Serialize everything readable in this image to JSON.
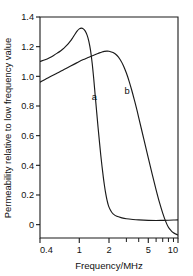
{
  "chart_data": {
    "type": "line",
    "title": "",
    "xlabel": "Frequency/MHz",
    "ylabel": "Permeability relative to low frequency value",
    "xscale": "log",
    "xlim": [
      0.4,
      10
    ],
    "ylim": [
      -0.09,
      1.4
    ],
    "grid": false,
    "legend_position": "inline-annotations",
    "x_ticks_major": [
      0.4,
      1,
      2,
      5,
      10
    ],
    "x_tick_labels": [
      "0.4",
      "1",
      "2",
      "5",
      "10"
    ],
    "x_ticks_minor": [
      3,
      4,
      6,
      7,
      8,
      9
    ],
    "y_ticks": [
      0,
      0.2,
      0.4,
      0.6,
      0.8,
      1.0,
      1.2,
      1.4
    ],
    "y_tick_labels": [
      "0",
      "0.2",
      "0.4",
      "0.6",
      "0.8",
      "1.0",
      "1.2",
      "1.4"
    ],
    "annotations": [
      {
        "text": "a",
        "x": 1.42,
        "y": 0.84
      },
      {
        "text": "b",
        "x": 3.05,
        "y": 0.88
      }
    ],
    "series": [
      {
        "name": "a",
        "label": "a",
        "color": "#1a1a1a",
        "points": [
          [
            0.4,
            1.1
          ],
          [
            0.45,
            1.112
          ],
          [
            0.5,
            1.126
          ],
          [
            0.55,
            1.141
          ],
          [
            0.6,
            1.157
          ],
          [
            0.65,
            1.173
          ],
          [
            0.7,
            1.19
          ],
          [
            0.75,
            1.21
          ],
          [
            0.8,
            1.232
          ],
          [
            0.85,
            1.256
          ],
          [
            0.9,
            1.282
          ],
          [
            0.95,
            1.305
          ],
          [
            1.0,
            1.32
          ],
          [
            1.05,
            1.325
          ],
          [
            1.1,
            1.32
          ],
          [
            1.15,
            1.305
          ],
          [
            1.2,
            1.278
          ],
          [
            1.25,
            1.236
          ],
          [
            1.3,
            1.175
          ],
          [
            1.35,
            1.09
          ],
          [
            1.4,
            0.985
          ],
          [
            1.45,
            0.87
          ],
          [
            1.5,
            0.76
          ],
          [
            1.55,
            0.655
          ],
          [
            1.6,
            0.56
          ],
          [
            1.65,
            0.47
          ],
          [
            1.7,
            0.392
          ],
          [
            1.75,
            0.322
          ],
          [
            1.8,
            0.262
          ],
          [
            1.85,
            0.212
          ],
          [
            1.9,
            0.172
          ],
          [
            1.95,
            0.141
          ],
          [
            2.0,
            0.118
          ],
          [
            2.1,
            0.09
          ],
          [
            2.2,
            0.073
          ],
          [
            2.4,
            0.056
          ],
          [
            2.7,
            0.046
          ],
          [
            3.0,
            0.04
          ],
          [
            3.5,
            0.035
          ],
          [
            4.0,
            0.032
          ],
          [
            5.0,
            0.029
          ],
          [
            6.0,
            0.028
          ],
          [
            7.0,
            0.029
          ],
          [
            8.0,
            0.03
          ],
          [
            9.0,
            0.031
          ],
          [
            10.0,
            0.032
          ]
        ]
      },
      {
        "name": "b",
        "label": "b",
        "color": "#1a1a1a",
        "points": [
          [
            0.4,
            0.96
          ],
          [
            0.5,
            0.995
          ],
          [
            0.6,
            1.022
          ],
          [
            0.7,
            1.046
          ],
          [
            0.8,
            1.066
          ],
          [
            0.9,
            1.084
          ],
          [
            1.0,
            1.1
          ],
          [
            1.1,
            1.113
          ],
          [
            1.2,
            1.124
          ],
          [
            1.3,
            1.134
          ],
          [
            1.4,
            1.142
          ],
          [
            1.5,
            1.15
          ],
          [
            1.6,
            1.158
          ],
          [
            1.7,
            1.164
          ],
          [
            1.8,
            1.168
          ],
          [
            1.9,
            1.17
          ],
          [
            2.0,
            1.169
          ],
          [
            2.2,
            1.16
          ],
          [
            2.4,
            1.142
          ],
          [
            2.6,
            1.112
          ],
          [
            2.8,
            1.072
          ],
          [
            3.0,
            1.022
          ],
          [
            3.2,
            0.966
          ],
          [
            3.4,
            0.906
          ],
          [
            3.6,
            0.845
          ],
          [
            3.8,
            0.784
          ],
          [
            4.0,
            0.722
          ],
          [
            4.5,
            0.578
          ],
          [
            5.0,
            0.45
          ],
          [
            5.5,
            0.336
          ],
          [
            6.0,
            0.235
          ],
          [
            6.5,
            0.148
          ],
          [
            7.0,
            0.078
          ],
          [
            7.5,
            0.022
          ],
          [
            8.0,
            -0.018
          ],
          [
            8.5,
            -0.04
          ],
          [
            9.0,
            -0.055
          ],
          [
            9.5,
            -0.064
          ],
          [
            10.0,
            -0.07
          ]
        ]
      }
    ]
  },
  "style": {
    "axis_color": "#1a1a1a",
    "curve_color": "#1a1a1a",
    "background": "#ffffff"
  }
}
